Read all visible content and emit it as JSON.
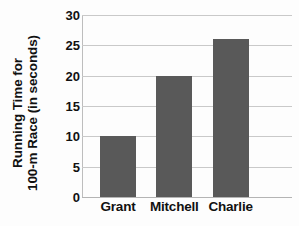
{
  "chart_data": {
    "type": "bar",
    "title": "",
    "subtitle": "",
    "xlabel": "",
    "ylabel_lines": [
      "Running Time for",
      "100-m Race (in seconds)"
    ],
    "ylabel": "Running Time for 100-m Race (in seconds)",
    "categories": [
      "Grant",
      "Mitchell",
      "Charlie"
    ],
    "values": [
      10,
      20,
      26
    ],
    "ylim": [
      0,
      30
    ],
    "y_ticks": [
      0,
      5,
      10,
      15,
      20,
      25,
      30
    ],
    "y_tick_labels": [
      "0",
      "5",
      "10",
      "15",
      "20",
      "25",
      "30"
    ],
    "grid": "horizontal",
    "legend": "none",
    "bar_color": "#595959",
    "grid_color": "#c9c9c9",
    "axis_color": "#b4b4b4",
    "text_color": "#111111",
    "background": "#ffffff"
  }
}
